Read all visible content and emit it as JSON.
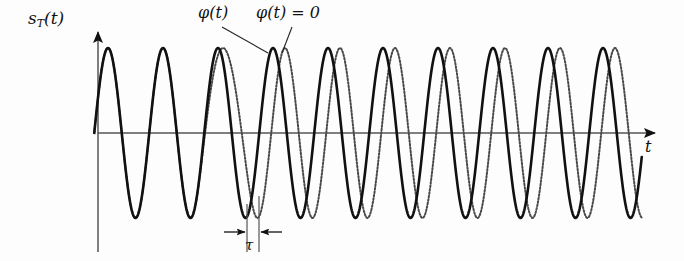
{
  "figure": {
    "background_color": "#fdfdfd",
    "width": 684,
    "height": 261
  },
  "axes": {
    "y_axis_label": "s",
    "y_axis_label_sub": "T",
    "y_axis_label_tail": "(t)",
    "x_axis_label": "t",
    "origin_x": 98,
    "baseline_y": 133,
    "x_axis_end": 662,
    "y_axis_top": 24,
    "y_axis_bottom": 252,
    "axis_color": "#555555",
    "arrow_color": "#111111"
  },
  "annotations": {
    "phi_modulated": "φ(t)",
    "phi_zero": "φ(t) = 0",
    "tau": "τ",
    "leader_1": {
      "from_x": 222,
      "from_y": 26,
      "to_x": 270,
      "to_y": 52
    },
    "leader_2": {
      "from_x": 288,
      "from_y": 26,
      "to_x": 283,
      "to_y": 52
    },
    "tau_marker": {
      "line_left_x": 247,
      "line_right_x": 259,
      "line_top_y": 205,
      "line_bottom_y": 252,
      "arrow_y": 232,
      "arrow_left_start_x": 226,
      "arrow_right_start_x": 280
    }
  },
  "curves": {
    "solid": {
      "name": "phi(t) modulated signal",
      "color": "#111111",
      "stroke_width": 2.6,
      "dashed": false
    },
    "dotted": {
      "name": "phi(t) = 0 reference carrier",
      "color": "#4a4a4a",
      "stroke_width": 2.0,
      "dashed": true,
      "dash_pattern": "1.6 1.9"
    }
  },
  "chart_data": {
    "type": "line",
    "title": "",
    "xlabel": "t",
    "ylabel": "s_T(t)",
    "grid": false,
    "legend": [
      "φ(t)",
      "φ(t) = 0"
    ],
    "x_range_px": [
      98,
      640
    ],
    "baseline_y_px": 133,
    "amplitude_px": 85,
    "period_px": 55.0,
    "peak_positions_px": [
      108,
      163,
      218,
      270,
      325,
      380,
      435,
      490,
      545,
      600
    ],
    "trough_positions_px": [
      136,
      191,
      246,
      298,
      353,
      408,
      463,
      518,
      573,
      628
    ],
    "series": [
      {
        "name": "φ(t)",
        "style": "solid",
        "phase_offset_cycles": 0.0,
        "description": "carrier whose phase advances by tau in the middle of the record"
      },
      {
        "name": "φ(t) = 0",
        "style": "dotted",
        "phase_offset_cycles": 0.0,
        "description": "unmodulated reference carrier, lags the modulated wave by tau after the phase step"
      }
    ],
    "phase_profile": {
      "start_lag_px": 0,
      "ramp_start_px": 195,
      "ramp_end_px": 258,
      "end_lag_px": 12,
      "note": "dotted reference is in phase at the left, then lags the solid signal by tau = 12 px for the remainder"
    }
  }
}
